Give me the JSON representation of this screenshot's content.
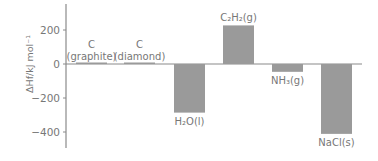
{
  "chart_data": {
    "type": "bar",
    "title": "",
    "xlabel": "",
    "ylabel": "ΔHf/kJ mol⁻¹",
    "ylim": [
      -480,
      340
    ],
    "yticks": [
      200,
      0,
      -200,
      -400
    ],
    "grid": false,
    "legend": null,
    "bar_color": "#9a9a9a",
    "axis_color": "#8a8a8a",
    "categories": [
      "C (graphite)",
      "C (diamond)",
      "H₂O(l)",
      "C₂H₂(g)",
      "NH₃(g)",
      "NaCl(s)"
    ],
    "values": [
      0,
      2,
      -286,
      227,
      -46,
      -411
    ],
    "labels": [
      {
        "lines": [
          "C",
          "(graphite)"
        ],
        "position": "above"
      },
      {
        "lines": [
          "C",
          "(diamond)"
        ],
        "position": "above"
      },
      {
        "lines": [
          "H₂O(l)"
        ],
        "position": "below"
      },
      {
        "lines": [
          "C₂H₂(g)"
        ],
        "position": "above"
      },
      {
        "lines": [
          "NH₃(g)"
        ],
        "position": "below"
      },
      {
        "lines": [
          "NaCl(s)"
        ],
        "position": "below"
      }
    ]
  }
}
